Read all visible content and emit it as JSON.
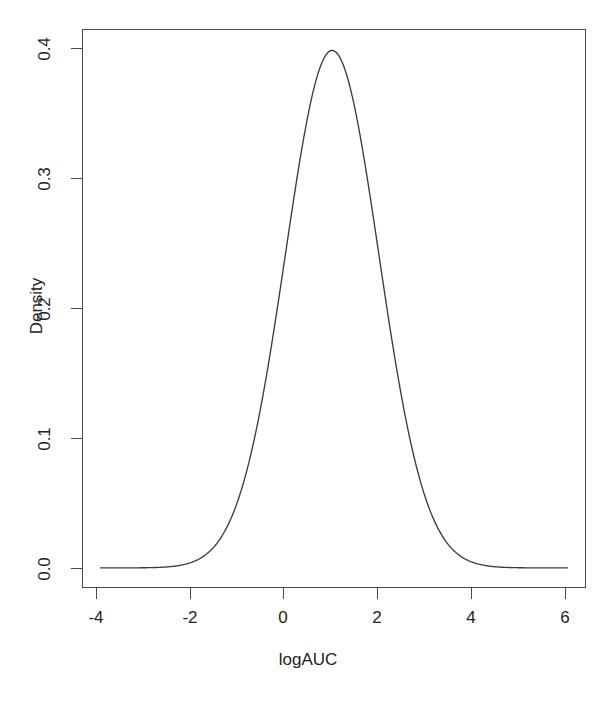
{
  "chart_data": {
    "type": "line",
    "title": "",
    "xlabel": "logAUC",
    "ylabel": "Density",
    "xlim": [
      -4.4,
      6.4
    ],
    "ylim": [
      -0.0155,
      0.4155
    ],
    "xticks": [
      -4,
      -2,
      0,
      2,
      4,
      6
    ],
    "xticklabels": [
      "-4",
      "-2",
      "0",
      "2",
      "4",
      "6"
    ],
    "yticks": [
      0.0,
      0.1,
      0.2,
      0.3,
      0.4
    ],
    "yticklabels": [
      "0.0",
      "0.1",
      "0.2",
      "0.3",
      "0.4"
    ],
    "grid": false,
    "legend": false,
    "line_color": "#3c3c3c",
    "series": [
      {
        "name": "density",
        "distribution": "normal",
        "mean": 0.96,
        "sd": 1.0,
        "peak_value": 0.399,
        "peak_x": 0.96,
        "x": [
          -4.0,
          -3.75,
          -3.5,
          -3.25,
          -3.0,
          -2.75,
          -2.5,
          -2.25,
          -2.0,
          -1.75,
          -1.5,
          -1.25,
          -1.0,
          -0.75,
          -0.5,
          -0.25,
          0.0,
          0.25,
          0.5,
          0.75,
          1.0,
          1.25,
          1.5,
          1.75,
          2.0,
          2.25,
          2.5,
          2.75,
          3.0,
          3.25,
          3.5,
          3.75,
          4.0,
          4.25,
          4.5,
          4.75,
          5.0,
          5.25,
          5.5,
          5.75,
          6.0
        ],
        "values": [
          0.0,
          0.0001,
          0.0002,
          0.0005,
          0.0012,
          0.0026,
          0.0052,
          0.0099,
          0.0178,
          0.0303,
          0.0488,
          0.0743,
          0.107,
          0.1457,
          0.1876,
          0.2286,
          0.2637,
          0.2879,
          0.2976,
          0.2912,
          0.2698,
          0.2366,
          0.1965,
          0.1544,
          0.1148,
          0.0808,
          0.0539,
          0.034,
          0.0203,
          0.0115,
          0.0061,
          0.0031,
          0.0015,
          0.0007,
          0.0003,
          0.0001,
          0.0,
          0.0,
          0.0,
          0.0,
          0.0
        ]
      }
    ]
  },
  "axes": {
    "x_title": "logAUC",
    "y_title": "Density"
  }
}
